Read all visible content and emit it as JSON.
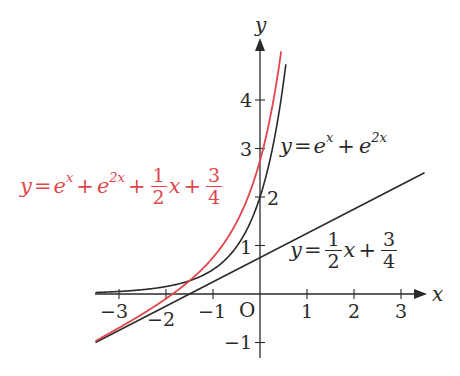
{
  "chart_data": {
    "type": "line",
    "title": "",
    "xlabel": "x",
    "ylabel": "y",
    "origin_label": "O",
    "xlim": [
      -3.5,
      3.5
    ],
    "ylim": [
      -1.2,
      5.2
    ],
    "grid": false,
    "x_ticks": [
      -3,
      -2,
      -1,
      1,
      2,
      3
    ],
    "x_tick_labels": [
      "−3",
      "−2",
      "−1",
      "1",
      "2",
      "3"
    ],
    "y_ticks": [
      -1,
      1,
      2,
      3,
      4
    ],
    "y_tick_labels": [
      "−1",
      "1",
      "2",
      "3",
      "4"
    ],
    "series": [
      {
        "name": "y = e^x + e^(2x)",
        "color": "#2a2a2a",
        "expression": "exp(x)+exp(2x)",
        "x": [
          -3.5,
          -3,
          -2,
          -1.5,
          -1,
          -0.5,
          0,
          0.25,
          0.5,
          0.55
        ],
        "values": [
          0.031,
          0.052,
          0.154,
          0.273,
          0.503,
          0.975,
          2.0,
          2.933,
          4.367,
          4.737
        ]
      },
      {
        "name": "y = e^x + e^(2x) + (1/2)x + 3/4",
        "color": "#e0464b",
        "expression": "exp(x)+exp(2x)+0.5x+0.75",
        "x": [
          -3.5,
          -3,
          -2,
          -1.5,
          -1,
          -0.5,
          0,
          0.25,
          0.45
        ],
        "values": [
          -0.969,
          -0.698,
          -0.096,
          0.273,
          0.753,
          1.475,
          2.75,
          3.808,
          4.783
        ]
      },
      {
        "name": "y = (1/2)x + 3/4",
        "color": "#2a2a2a",
        "expression": "0.5x+0.75",
        "x": [
          -3.5,
          3.5
        ],
        "values": [
          -1.0,
          2.5
        ]
      }
    ],
    "annotations": [
      {
        "text": "y = e^x + e^(2x)",
        "color": "#2a2a2a"
      },
      {
        "text": "y = e^x + e^(2x) + (1/2)x + 3/4",
        "color": "#e0464b"
      },
      {
        "text": "y = (1/2)x + 3/4",
        "color": "#2a2a2a"
      }
    ]
  },
  "labels": {
    "x_axis": "x",
    "y_axis": "y",
    "origin": "O",
    "ticks_x": [
      "−3",
      "−2",
      "−1",
      "1",
      "2",
      "3"
    ],
    "ticks_y": [
      "−1",
      "1",
      "2",
      "3",
      "4"
    ],
    "eq_black_curve": {
      "y": "y",
      "eq": "=",
      "e1": "e",
      "sup1": "x",
      "plus": "+",
      "e2": "e",
      "sup2": "2x"
    },
    "eq_red_curve": {
      "y": "y",
      "eq": "=",
      "e1": "e",
      "sup1": "x",
      "plus1": "+",
      "e2": "e",
      "sup2": "2x",
      "plus2": "+",
      "num1": "1",
      "den1": "2",
      "x": "x",
      "plus3": "+",
      "num2": "3",
      "den2": "4"
    },
    "eq_line": {
      "y": "y",
      "eq": "=",
      "num1": "1",
      "den1": "2",
      "x": "x",
      "plus": "+",
      "num2": "3",
      "den2": "4"
    }
  },
  "colors": {
    "axis": "#2a2a2a",
    "black_curve": "#2a2a2a",
    "red_curve": "#e0464b",
    "line": "#2a2a2a"
  }
}
